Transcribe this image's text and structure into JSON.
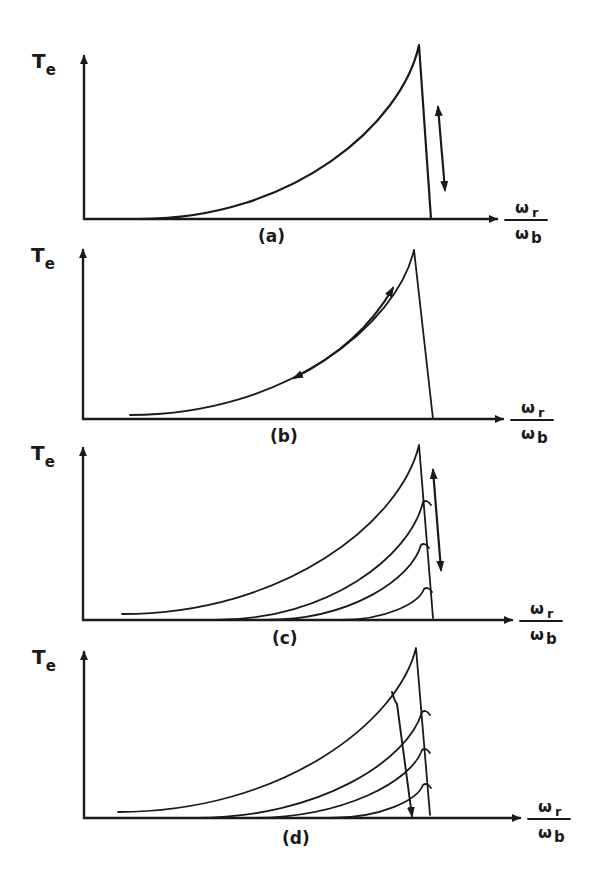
{
  "figure": {
    "ink_color": "#1a1a1a",
    "background": "#ffffff"
  },
  "chart_data": [
    {
      "type": "line",
      "panel": "(a)",
      "ylabel_main": "T",
      "ylabel_sub": "e",
      "xlabel_num_main": "ω",
      "xlabel_num_sub": "r",
      "xlabel_den_main": "ω",
      "xlabel_den_sub": "b",
      "axes": {
        "origin": [
          84,
          219
        ],
        "y_top": 56,
        "x_end": 497
      },
      "curves": [
        {
          "start": [
            140,
            219
          ],
          "peak": [
            419,
            45
          ],
          "end": [
            431,
            219
          ],
          "width": 2.2
        }
      ],
      "arrows": [
        {
          "kind": "double",
          "from": [
            438,
            107
          ],
          "to": [
            445,
            190
          ]
        }
      ],
      "label_pos": [
        258,
        242
      ]
    },
    {
      "type": "line",
      "panel": "(b)",
      "ylabel_main": "T",
      "ylabel_sub": "e",
      "xlabel_num_main": "ω",
      "xlabel_num_sub": "r",
      "xlabel_den_main": "ω",
      "xlabel_den_sub": "b",
      "axes": {
        "origin": [
          83,
          419
        ],
        "y_top": 250,
        "x_end": 503
      },
      "curves": [
        {
          "start": [
            130,
            415
          ],
          "peak": [
            414,
            250
          ],
          "end": [
            433,
            419
          ],
          "width": 1.8
        }
      ],
      "arrows": [
        {
          "kind": "double-curved",
          "from": [
            393,
            288
          ],
          "to": [
            294,
            378
          ],
          "ctrl": [
            360,
            345
          ]
        }
      ],
      "label_pos": [
        270,
        442
      ]
    },
    {
      "type": "line",
      "panel": "(c)",
      "ylabel_main": "T",
      "ylabel_sub": "e",
      "xlabel_num_main": "ω",
      "xlabel_num_sub": "r",
      "xlabel_den_main": "ω",
      "xlabel_den_sub": "b",
      "axes": {
        "origin": [
          83,
          620
        ],
        "y_top": 448,
        "x_end": 512
      },
      "curves": [
        {
          "start": [
            122,
            614
          ],
          "peak": [
            419,
            445
          ],
          "end": [
            433,
            618
          ],
          "width": 1.8
        },
        {
          "start": [
            215,
            620
          ],
          "peak": [
            423,
            502
          ],
          "end": null,
          "width": 1.8
        },
        {
          "start": [
            265,
            620
          ],
          "peak": [
            421,
            545
          ],
          "end": null,
          "width": 1.8
        },
        {
          "start": [
            340,
            620
          ],
          "peak": [
            424,
            589
          ],
          "end": null,
          "width": 1.8
        }
      ],
      "arrows": [
        {
          "kind": "double",
          "from": [
            433,
            470
          ],
          "to": [
            441,
            570
          ]
        }
      ],
      "label_pos": [
        272,
        644
      ]
    },
    {
      "type": "line",
      "panel": "(d)",
      "ylabel_main": "T",
      "ylabel_sub": "e",
      "xlabel_num_main": "ω",
      "xlabel_num_sub": "r",
      "xlabel_den_main": "ω",
      "xlabel_den_sub": "b",
      "axes": {
        "origin": [
          84,
          818
        ],
        "y_top": 652,
        "x_end": 520
      },
      "curves": [
        {
          "start": [
            118,
            812
          ],
          "peak": [
            416,
            648
          ],
          "end": [
            430,
            815
          ],
          "width": 1.8
        },
        {
          "start": [
            195,
            818
          ],
          "peak": [
            422,
            712
          ],
          "end": null,
          "width": 1.8
        },
        {
          "start": [
            250,
            818
          ],
          "peak": [
            422,
            750
          ],
          "end": null,
          "width": 1.8
        },
        {
          "start": [
            330,
            818
          ],
          "peak": [
            423,
            785
          ],
          "end": null,
          "width": 1.8
        }
      ],
      "arrows": [
        {
          "kind": "single-down",
          "from": [
            392,
            692
          ],
          "to": [
            412,
            816
          ]
        }
      ],
      "label_pos": [
        282,
        844
      ]
    }
  ]
}
